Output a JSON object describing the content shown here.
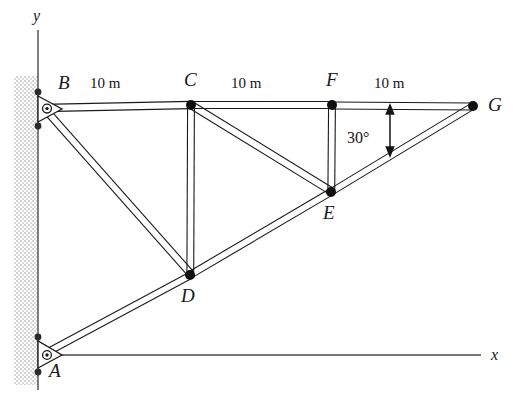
{
  "figure": {
    "axes": {
      "y_label": "y",
      "x_label": "x"
    },
    "nodes": [
      {
        "id": "B",
        "label": "B",
        "x": 43,
        "y": 108,
        "label_x": 58,
        "label_y": 75,
        "support": "pin"
      },
      {
        "id": "C",
        "label": "C",
        "x": 191,
        "y": 105,
        "label_x": 184,
        "label_y": 72,
        "support": "none"
      },
      {
        "id": "F",
        "label": "F",
        "x": 332,
        "y": 105,
        "label_x": 326,
        "label_y": 72,
        "support": "none"
      },
      {
        "id": "G",
        "label": "G",
        "x": 473,
        "y": 106,
        "label_x": 489,
        "label_y": 96,
        "support": "none"
      },
      {
        "id": "E",
        "label": "E",
        "x": 331,
        "y": 192,
        "label_x": 324,
        "label_y": 205,
        "support": "none"
      },
      {
        "id": "D",
        "label": "D",
        "x": 190,
        "y": 275,
        "label_x": 182,
        "label_y": 288,
        "support": "none"
      },
      {
        "id": "A",
        "label": "A",
        "x": 41,
        "y": 355,
        "label_x": 50,
        "label_y": 363,
        "support": "pin"
      }
    ],
    "members": [
      {
        "from": "B",
        "to": "C"
      },
      {
        "from": "C",
        "to": "F"
      },
      {
        "from": "F",
        "to": "G"
      },
      {
        "from": "A",
        "to": "D"
      },
      {
        "from": "D",
        "to": "E"
      },
      {
        "from": "E",
        "to": "G"
      },
      {
        "from": "B",
        "to": "D"
      },
      {
        "from": "C",
        "to": "D"
      },
      {
        "from": "C",
        "to": "E"
      },
      {
        "from": "F",
        "to": "E"
      }
    ],
    "dimensions": [
      {
        "label": "10 m",
        "x": 92,
        "y": 79,
        "span": "B-C"
      },
      {
        "label": "10 m",
        "x": 233,
        "y": 79,
        "span": "C-F"
      },
      {
        "label": "10 m",
        "x": 376,
        "y": 79,
        "span": "F-G"
      }
    ],
    "angle_annotation": {
      "label": "30°",
      "label_x": 349,
      "label_y": 132,
      "arrow_x": 390,
      "arrow_top_y": 108,
      "arrow_bottom_y": 152
    },
    "wall": {
      "left": 14,
      "top": 76,
      "width": 24,
      "height": 309
    },
    "colors": {
      "ink": "#1a1a1a",
      "member_fill": "#ffffff",
      "wall_hatch": "#8c8c8c",
      "background": "#ffffff",
      "node_dot": "#101010"
    }
  }
}
